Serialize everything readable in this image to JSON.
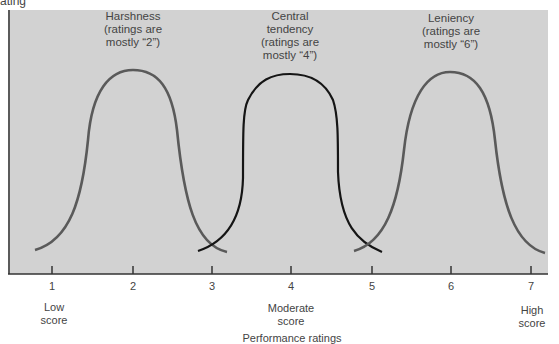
{
  "figure": {
    "y_axis_label_fragment": "ating",
    "x_axis_title_fragment": "Performance ratings",
    "background_color": "#d2d2d2",
    "curves": [
      {
        "id": "harshness",
        "title": "Harshness",
        "caption_line2": "(ratings are",
        "caption_line3": "mostly “2”)",
        "center": 2,
        "color": "#555555"
      },
      {
        "id": "central",
        "title": "Central",
        "caption_line1b": "tendency",
        "caption_line2": "(ratings are",
        "caption_line3": "mostly “4”)",
        "center": 4,
        "color": "#111111"
      },
      {
        "id": "leniency",
        "title": "Leniency",
        "caption_line2": "(ratings are",
        "caption_line3": "mostly “6”)",
        "center": 6,
        "color": "#555555"
      }
    ],
    "ticks": [
      "1",
      "2",
      "3",
      "4",
      "5",
      "6",
      "7"
    ],
    "anchors": {
      "low": {
        "line1": "Low",
        "line2": "score"
      },
      "moderate": {
        "line1": "Moderate",
        "line2": "score"
      },
      "high": {
        "line1": "High",
        "line2": "score"
      }
    }
  }
}
